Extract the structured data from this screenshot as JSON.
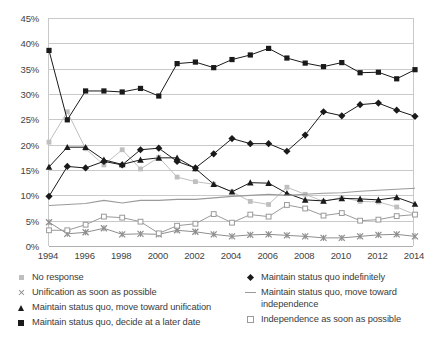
{
  "chart_data": {
    "type": "line",
    "title": "",
    "subtitle": "",
    "xlabel": "",
    "ylabel": "",
    "x": [
      1994,
      1995,
      1996,
      1997,
      1998,
      1999,
      2000,
      2001,
      2002,
      2003,
      2004,
      2005,
      2006,
      2007,
      2008,
      2009,
      2010,
      2011,
      2012,
      2013,
      2014
    ],
    "xtick_labels": [
      "1994",
      "1996",
      "1998",
      "2000",
      "2002",
      "2004",
      "2006",
      "2008",
      "2010",
      "2012",
      "2014"
    ],
    "xtick_values": [
      1994,
      1996,
      1998,
      2000,
      2002,
      2004,
      2006,
      2008,
      2010,
      2012,
      2014
    ],
    "ytick_labels": [
      "0%",
      "5%",
      "10%",
      "15%",
      "20%",
      "25%",
      "30%",
      "35%",
      "40%",
      "45%"
    ],
    "ytick_values": [
      0,
      5,
      10,
      15,
      20,
      25,
      30,
      35,
      40,
      45
    ],
    "ylim": [
      0,
      45
    ],
    "xlim": [
      1994,
      2014
    ],
    "grid": true,
    "grid_axis": "y",
    "legend_position": "bottom",
    "legend_columns": 2,
    "series": [
      {
        "name": "No response",
        "marker": "square-filled-gray",
        "color": "#bfbfbf",
        "legend_column": "left",
        "values": [
          20.5,
          26.5,
          19.2,
          16.0,
          19.0,
          15.2,
          17.5,
          13.6,
          12.7,
          12.2,
          10.7,
          8.8,
          8.2,
          11.6,
          10.2,
          8.8,
          9.6,
          8.8,
          8.7,
          7.7,
          6.2
        ]
      },
      {
        "name": "Unification as soon as possible",
        "marker": "x-gray",
        "color": "#8f8f8f",
        "legend_column": "left",
        "values": [
          4.7,
          2.4,
          2.7,
          3.5,
          2.3,
          2.4,
          2.3,
          3.1,
          2.8,
          2.3,
          1.9,
          2.2,
          2.3,
          2.1,
          1.9,
          1.6,
          1.6,
          1.9,
          2.2,
          2.3,
          1.9
        ]
      },
      {
        "name": "Maintain status quo, move toward unification",
        "marker": "triangle-filled-black",
        "color": "#1a1a1a",
        "legend_column": "left",
        "values": [
          15.6,
          19.5,
          19.5,
          17.0,
          16.1,
          17.0,
          17.4,
          17.4,
          15.3,
          12.2,
          10.7,
          12.5,
          12.4,
          10.4,
          9.1,
          8.9,
          9.4,
          9.3,
          9.1,
          9.6,
          8.3
        ]
      },
      {
        "name": "Maintain status quo, decide at a later date",
        "marker": "square-filled-black",
        "color": "#1a1a1a",
        "legend_column": "left",
        "values": [
          38.6,
          24.9,
          30.6,
          30.6,
          30.4,
          31.1,
          29.6,
          36.0,
          36.3,
          35.2,
          36.8,
          37.7,
          39.0,
          37.1,
          36.1,
          35.4,
          36.2,
          34.2,
          34.3,
          33.0,
          34.8
        ]
      },
      {
        "name": "Maintain status quo indefinitely",
        "marker": "diamond-filled-black",
        "color": "#1a1a1a",
        "legend_column": "right",
        "values": [
          9.8,
          15.7,
          15.4,
          16.7,
          16.0,
          19.0,
          19.3,
          16.7,
          15.4,
          18.2,
          21.2,
          20.2,
          20.2,
          18.7,
          21.9,
          26.5,
          25.7,
          27.9,
          28.2,
          26.8,
          25.6
        ]
      },
      {
        "name": "Maintain status quo, move toward independence",
        "marker": "line-gray",
        "color": "#9a9a9a",
        "legend_column": "right",
        "values": [
          8.0,
          8.2,
          8.4,
          9.0,
          8.5,
          9.0,
          9.0,
          9.2,
          9.2,
          9.5,
          9.8,
          10.0,
          10.2,
          10.0,
          10.2,
          10.4,
          10.5,
          10.8,
          11.0,
          11.2,
          11.4
        ]
      },
      {
        "name": "Independence as soon as possible",
        "marker": "square-open",
        "color": "#9a9a9a",
        "legend_column": "right",
        "values": [
          3.1,
          3.1,
          4.2,
          5.8,
          5.6,
          4.8,
          2.5,
          4.0,
          4.4,
          6.3,
          4.6,
          6.2,
          5.8,
          8.1,
          7.4,
          6.0,
          6.5,
          5.0,
          5.2,
          5.9,
          6.2
        ]
      }
    ]
  },
  "axes": {
    "y_ticks": [
      "0%",
      "5%",
      "10%",
      "15%",
      "20%",
      "25%",
      "30%",
      "35%",
      "40%",
      "45%"
    ],
    "x_ticks": [
      "1994",
      "1996",
      "1998",
      "2000",
      "2002",
      "2004",
      "2006",
      "2008",
      "2010",
      "2012",
      "2014"
    ]
  },
  "legend": {
    "left": [
      {
        "label": "No response",
        "icon": "square-gray-icon"
      },
      {
        "label": "Unification as soon as possible",
        "icon": "x-mark-gray-icon"
      },
      {
        "label": "Maintain status quo, move toward unification",
        "icon": "triangle-black-icon"
      },
      {
        "label": "Maintain status quo, decide at a later date",
        "icon": "square-black-icon"
      }
    ],
    "right": [
      {
        "label": "Maintain status quo indefinitely",
        "icon": "diamond-black-icon"
      },
      {
        "label": "Maintain status quo, move toward independence",
        "icon": "line-gray-icon"
      },
      {
        "label": "Independence as soon as possible",
        "icon": "square-open-icon"
      }
    ]
  }
}
